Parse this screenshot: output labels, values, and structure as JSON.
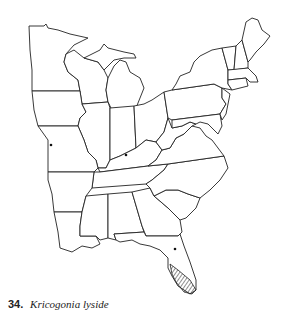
{
  "map": {
    "region": "Eastern United States",
    "records": [
      {
        "label": "Missouri record",
        "x": 51,
        "y": 145
      },
      {
        "label": "Kentucky record",
        "x": 126,
        "y": 155
      },
      {
        "label": "Central Florida record",
        "x": 175,
        "y": 249
      }
    ],
    "shaded_range": "Southern Florida peninsula"
  },
  "caption": {
    "number": "34.",
    "species": "Kricogonia lyside"
  }
}
